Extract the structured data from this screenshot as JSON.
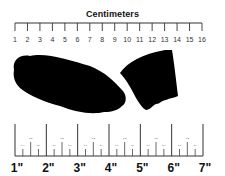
{
  "cm_ruler": {
    "title": "Centimeters",
    "labels": [
      "1",
      "2",
      "3",
      "4",
      "5",
      "6",
      "7",
      "8",
      "9",
      "10",
      "11",
      "12",
      "13",
      "14",
      "15",
      "16"
    ]
  },
  "inch_ruler": {
    "labels": [
      "1\"",
      "2\"",
      "3\"",
      "4\"",
      "5\"",
      "6\"",
      "7\""
    ],
    "fraction_labels": [
      "1/4",
      "1/2",
      "3/4"
    ]
  },
  "image": {
    "description": "Black silhouette of a pair of severed fossil/bone fragments placed between two measuring scales",
    "colors": {
      "silhouette": "#000000",
      "background": "#ffffff",
      "ruler": "#333333"
    }
  }
}
